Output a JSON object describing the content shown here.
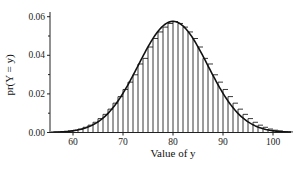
{
  "chart_data": {
    "type": "bar",
    "title": "",
    "xlabel": "Value of y",
    "ylabel": "pr(Y = y)",
    "xlim": [
      55,
      104
    ],
    "ylim": [
      0,
      0.06
    ],
    "x_ticks": [
      60,
      70,
      80,
      90,
      100
    ],
    "y_ticks": [
      "0.00",
      "0.02",
      "0.04",
      "0.06"
    ],
    "y_minor_ticks": [
      0.01,
      0.03,
      0.05
    ],
    "grid": false,
    "legend": null,
    "series": [
      {
        "name": "pr(Y = y)",
        "kind": "bars",
        "x": [
          56,
          57,
          58,
          59,
          60,
          61,
          62,
          63,
          64,
          65,
          66,
          67,
          68,
          69,
          70,
          71,
          72,
          73,
          74,
          75,
          76,
          77,
          78,
          79,
          80,
          81,
          82,
          83,
          84,
          85,
          86,
          87,
          88,
          89,
          90,
          91,
          92,
          93,
          94,
          95,
          96,
          97,
          98,
          99,
          100,
          101,
          102,
          103
        ],
        "values": [
          0.0002,
          0.0003,
          0.0005,
          0.0008,
          0.0012,
          0.0018,
          0.0027,
          0.0038,
          0.0053,
          0.0072,
          0.0094,
          0.0121,
          0.0152,
          0.0186,
          0.0223,
          0.0261,
          0.0299,
          0.0355,
          0.0384,
          0.0443,
          0.0487,
          0.0521,
          0.0546,
          0.0565,
          0.0575,
          0.0565,
          0.0546,
          0.0521,
          0.0487,
          0.0443,
          0.0384,
          0.0355,
          0.0299,
          0.0261,
          0.0223,
          0.0186,
          0.0152,
          0.0121,
          0.0094,
          0.0072,
          0.0053,
          0.0038,
          0.0027,
          0.0018,
          0.0012,
          0.0008,
          0.0005,
          0.0003
        ]
      },
      {
        "name": "approximating curve",
        "kind": "line",
        "mean": 80,
        "sd": 6.93
      }
    ]
  }
}
